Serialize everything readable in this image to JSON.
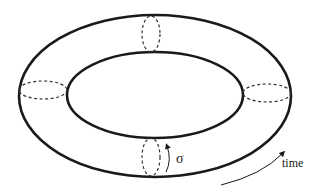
{
  "diagram": {
    "type": "torus-worldsheet",
    "labels": {
      "sigma": "σ",
      "time": "time"
    },
    "colors": {
      "stroke": "#1a1a1a",
      "dashed": "#333333",
      "background": "#ffffff"
    }
  }
}
